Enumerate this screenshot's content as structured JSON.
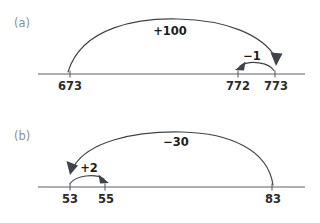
{
  "figure": {
    "stroke_color": "#3f444c",
    "line_color": "#5b6068",
    "label_color": "#1d1d1d",
    "panel_letter_color": "#8c8f94",
    "background": "#ffffff"
  },
  "panels": [
    {
      "letter": "(a)",
      "ticks": [
        {
          "value": "673",
          "x": 70
        },
        {
          "value": "772",
          "x": 238
        },
        {
          "value": "773",
          "x": 275
        }
      ],
      "jumps": [
        {
          "label": "+100",
          "from": "673",
          "to": "773",
          "direction": "right"
        },
        {
          "label": "−1",
          "from": "773",
          "to": "772",
          "direction": "left"
        }
      ]
    },
    {
      "letter": "(b)",
      "ticks": [
        {
          "value": "53",
          "x": 70
        },
        {
          "value": "55",
          "x": 105
        },
        {
          "value": "83",
          "x": 272
        }
      ],
      "jumps": [
        {
          "label": "−30",
          "from": "83",
          "to": "53",
          "direction": "left"
        },
        {
          "label": "+2",
          "from": "53",
          "to": "55",
          "direction": "right"
        }
      ]
    }
  ]
}
